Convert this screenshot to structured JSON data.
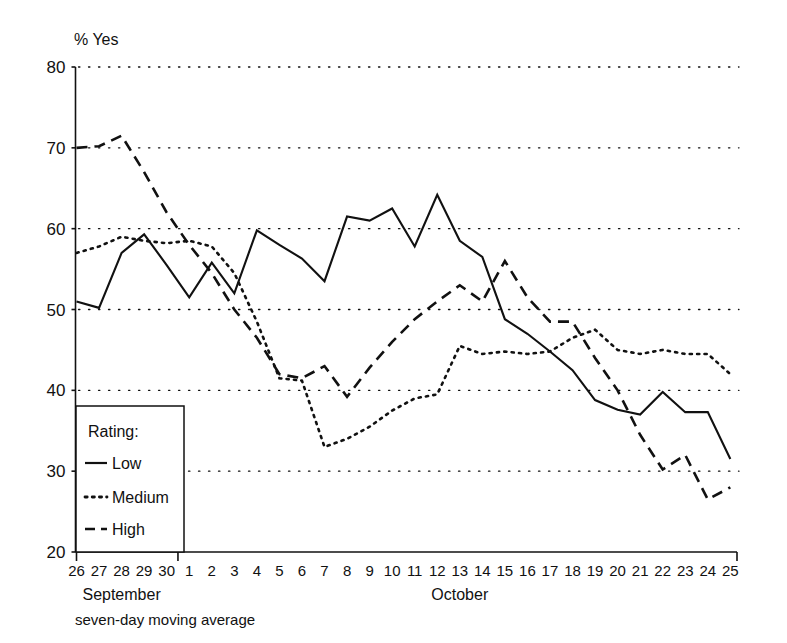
{
  "chart_data": {
    "type": "line",
    "title": "",
    "ylabel": "% Yes",
    "xlabel": "",
    "footnote": "seven-day moving average",
    "ylim": [
      20,
      80
    ],
    "yticks": [
      20,
      30,
      40,
      50,
      60,
      70,
      80
    ],
    "grid": true,
    "legend_position": "inside-bottom-left",
    "legend_title": "Rating:",
    "categories": [
      "26",
      "27",
      "28",
      "29",
      "30",
      "1",
      "2",
      "3",
      "4",
      "5",
      "6",
      "7",
      "8",
      "9",
      "10",
      "11",
      "12",
      "13",
      "14",
      "15",
      "16",
      "17",
      "18",
      "19",
      "20",
      "21",
      "22",
      "23",
      "24",
      "25"
    ],
    "x_groups": [
      {
        "label": "September",
        "start": "26",
        "end": "30"
      },
      {
        "label": "October",
        "start": "1",
        "end": "25"
      }
    ],
    "series": [
      {
        "name": "Low",
        "style": "solid",
        "values": [
          51.0,
          50.2,
          57.0,
          59.3,
          55.5,
          51.5,
          55.8,
          52.0,
          59.8,
          58.0,
          56.3,
          53.5,
          61.5,
          61.0,
          62.5,
          57.8,
          64.2,
          58.5,
          56.5,
          48.8,
          47.0,
          44.8,
          42.5,
          38.8,
          37.6,
          37.0,
          39.8,
          37.3,
          37.3,
          31.5
        ]
      },
      {
        "name": "Medium",
        "style": "dotted",
        "values": [
          57.0,
          57.8,
          59.0,
          58.5,
          58.2,
          58.5,
          57.8,
          54.5,
          48.5,
          41.5,
          41.2,
          33.0,
          34.0,
          35.5,
          37.5,
          39.0,
          39.5,
          45.5,
          44.5,
          44.8,
          44.5,
          44.8,
          46.5,
          47.5,
          45.0,
          44.5,
          45.0,
          44.5,
          44.5,
          42.0
        ]
      },
      {
        "name": "High",
        "style": "dashed",
        "values": [
          70.0,
          70.2,
          71.5,
          67.0,
          62.0,
          58.0,
          54.5,
          50.0,
          46.5,
          42.0,
          41.5,
          43.0,
          39.2,
          42.8,
          46.0,
          48.8,
          51.0,
          53.0,
          51.0,
          56.0,
          51.5,
          48.5,
          48.5,
          44.0,
          40.0,
          34.5,
          30.2,
          32.0,
          26.5,
          28.0
        ]
      }
    ]
  },
  "footnote": "seven-day moving average",
  "axis": {
    "y_title": "% Yes"
  }
}
